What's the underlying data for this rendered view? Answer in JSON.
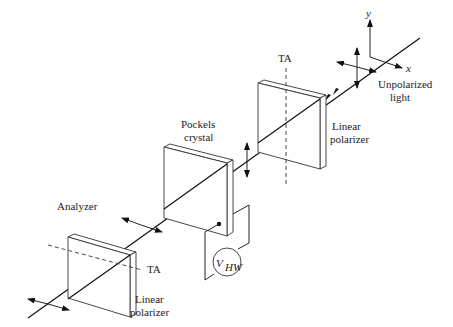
{
  "figure": {
    "labels": {
      "axis_y": "y",
      "axis_x": "x",
      "unpolarized_line1": "Unpolarized",
      "unpolarized_line2": "light",
      "ta_top": "TA",
      "polarizer1_line1": "Linear",
      "polarizer1_line2": "polarizer",
      "pockels_line1": "Pockels",
      "pockels_line2": "crystal",
      "analyzer": "Analyzer",
      "ta_bottom": "TA",
      "polarizer2_line1": "Linear",
      "polarizer2_line2": "polarizer",
      "voltage_main": "V",
      "voltage_sub": "HW"
    },
    "components": [
      {
        "name": "Unpolarized light source",
        "position": "top-right"
      },
      {
        "name": "Linear polarizer",
        "transmission_axis": "vertical"
      },
      {
        "name": "Pockels crystal",
        "connected_to": "V_HW voltage source"
      },
      {
        "name": "Analyzer (Linear polarizer)",
        "transmission_axis": "horizontal"
      }
    ],
    "colors": {
      "line": "#222222",
      "background": "#ffffff"
    }
  }
}
